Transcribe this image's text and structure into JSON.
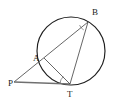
{
  "figure": {
    "type": "geometry-diagram",
    "background_color": "#ffffff",
    "stroke_color": "#3c3c3c",
    "circle_stroke_color": "#1e1e1e",
    "label_color": "#1a1a1a"
  },
  "circle": {
    "name": "main-circle",
    "cx": 71,
    "cy": 51,
    "r": 34
  },
  "points": [
    {
      "id": "P",
      "label": "P",
      "x": 14,
      "y": 82,
      "label_x": 8,
      "label_y": 86,
      "on_circle": false
    },
    {
      "id": "A",
      "label": "A",
      "x": 44,
      "y": 58,
      "label_x": 33,
      "label_y": 61,
      "on_circle": true
    },
    {
      "id": "B",
      "label": "B",
      "x": 88,
      "y": 22,
      "label_x": 92,
      "label_y": 15,
      "on_circle": true
    },
    {
      "id": "T",
      "label": "T",
      "x": 70,
      "y": 84,
      "label_x": 67,
      "label_y": 97,
      "on_circle": true
    }
  ],
  "segments": [
    {
      "id": "PB",
      "name": "secant-p-to-b",
      "from": "P",
      "to": "B"
    },
    {
      "id": "PT",
      "name": "tangent-p-to-t",
      "from": "P",
      "to": "T"
    },
    {
      "id": "AT",
      "name": "chord-a-to-t",
      "from": "A",
      "to": "T"
    },
    {
      "id": "BT",
      "name": "chord-b-to-t",
      "from": "B",
      "to": "T"
    }
  ],
  "angle_marks": [
    {
      "id": "angle-B",
      "name": "angle-mark-at-b",
      "vertex": "B",
      "cx": 88,
      "cy": 22,
      "radius": 9,
      "start_deg": 118,
      "end_deg": 160
    },
    {
      "id": "angle-T",
      "name": "angle-mark-at-t",
      "vertex": "T",
      "cx": 70,
      "cy": 84,
      "radius": 10,
      "start_deg": 182,
      "end_deg": 228
    }
  ],
  "labels": {
    "p": "P",
    "a": "A",
    "b": "B",
    "t": "T"
  }
}
